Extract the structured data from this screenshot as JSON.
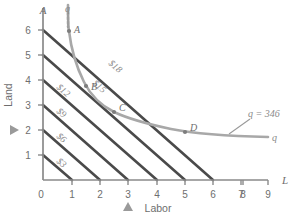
{
  "chart_data": {
    "type": "line",
    "title": "",
    "xlabel": "Labor",
    "ylabel": "Land",
    "x_axis_symbol": "L",
    "y_axis_symbol": "A",
    "xlim": [
      0,
      9
    ],
    "ylim": [
      0,
      6.6
    ],
    "xticks": [
      "0",
      "1",
      "2",
      "3",
      "4",
      "5",
      "6",
      "7",
      "8",
      "9"
    ],
    "yticks": [
      "1",
      "2",
      "3",
      "4",
      "5",
      "6"
    ],
    "grid": false,
    "legend": "none",
    "isoquant": {
      "name": "q",
      "label": "q",
      "value_label": "q = 346",
      "quantity": 346,
      "color": "#a8a8a8",
      "points": [
        {
          "x": 0.88,
          "y": 6.55
        },
        {
          "x": 0.9,
          "y": 6.0
        },
        {
          "x": 1.0,
          "y": 5.0
        },
        {
          "x": 1.15,
          "y": 4.2
        },
        {
          "x": 1.35,
          "y": 3.6
        },
        {
          "x": 1.6,
          "y": 3.2
        },
        {
          "x": 2.0,
          "y": 3.0
        },
        {
          "x": 2.4,
          "y": 2.45
        },
        {
          "x": 3.0,
          "y": 2.0
        },
        {
          "x": 3.8,
          "y": 1.75
        },
        {
          "x": 4.8,
          "y": 1.58
        },
        {
          "x": 6.0,
          "y": 1.5
        },
        {
          "x": 7.4,
          "y": 1.45
        },
        {
          "x": 8.8,
          "y": 1.42
        }
      ]
    },
    "isocost_lines": [
      {
        "label": "$3",
        "cost": 3,
        "intercept": 1,
        "slope": -1,
        "color": "#4a4a4a"
      },
      {
        "label": "$6",
        "cost": 6,
        "intercept": 2,
        "slope": -1,
        "color": "#4a4a4a"
      },
      {
        "label": "$9",
        "cost": 9,
        "intercept": 3,
        "slope": -1,
        "color": "#4a4a4a"
      },
      {
        "label": "$12",
        "cost": 12,
        "intercept": 4,
        "slope": -1,
        "color": "#4a4a4a"
      },
      {
        "label": "$15",
        "cost": 15,
        "intercept": 5,
        "slope": -1,
        "color": "#4a4a4a"
      },
      {
        "label": "$18",
        "cost": 18,
        "intercept": 6,
        "slope": -1,
        "color": "#4a4a4a"
      }
    ],
    "points": [
      {
        "label": "A",
        "x": 0.9,
        "y": 6.0
      },
      {
        "label": "B",
        "x": 2.0,
        "y": 3.0
      },
      {
        "label": "C",
        "x": 3.0,
        "y": 2.0
      },
      {
        "label": "D",
        "x": 6.0,
        "y": 1.5
      }
    ],
    "markers": [
      {
        "name": "land-marker",
        "axis": "y",
        "value": 2,
        "shape": "triangle-right",
        "color": "#9a9a9a"
      },
      {
        "name": "labor-marker",
        "axis": "x",
        "value": 3,
        "shape": "triangle-up",
        "color": "#9a9a9a"
      }
    ],
    "colors": {
      "isocost": "#4a4a4a",
      "isoquant": "#a8a8a8",
      "axis": "#8a8a8a",
      "text": "#6e6e6e",
      "background": "#ffffff"
    }
  },
  "labels": {
    "cost_3": "$3",
    "cost_6": "$6",
    "cost_9": "$9",
    "cost_12": "$12",
    "cost_15": "$15",
    "cost_18": "$18",
    "point_a": "A",
    "point_b": "B",
    "point_c": "C",
    "point_d": "D",
    "q_top": "q",
    "q_right": "q",
    "q_value": "q = 346",
    "axis_a": "A",
    "axis_l": "L",
    "y_title": "Land",
    "x_title": "Labor",
    "t0": "0",
    "t1": "1",
    "t2": "2",
    "t3": "3",
    "t4": "4",
    "t5": "5",
    "t6": "6",
    "t7": "7",
    "t8": "8",
    "t9": "9",
    "y1": "1",
    "y2": "2",
    "y3": "3",
    "y4": "4",
    "y5": "5",
    "y6": "6"
  }
}
